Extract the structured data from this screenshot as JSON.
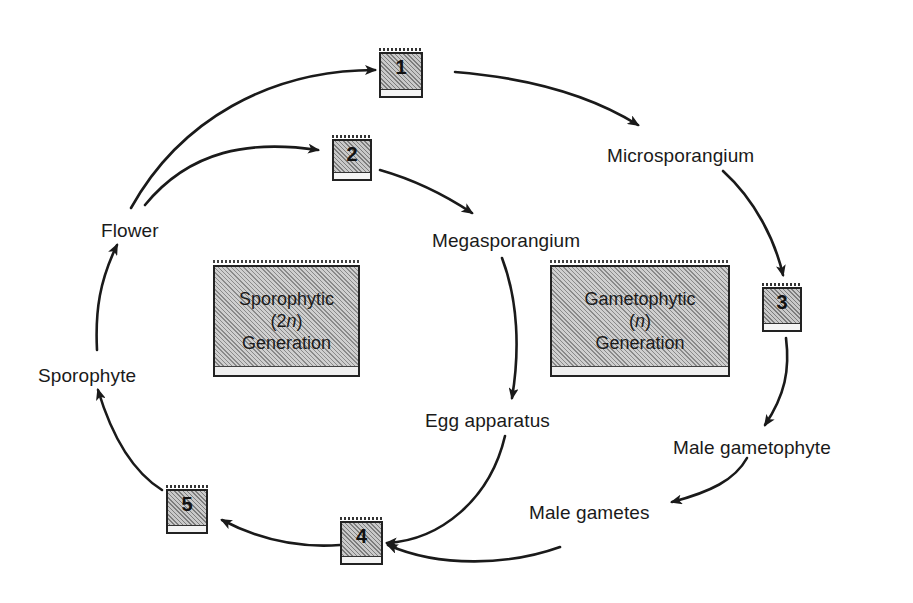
{
  "diagram": {
    "type": "life-cycle",
    "colors": {
      "ink": "#1a1a1a",
      "box_fill": "#a8a8a8",
      "background": "#ffffff"
    },
    "nodes": {
      "flower": "Flower",
      "sporophyte": "Sporophyte",
      "microsporangium": "Microsporangium",
      "megasporangium": "Megasporangium",
      "egg_apparatus": "Egg apparatus",
      "male_gametophyte": "Male gametophyte",
      "male_gametes": "Male gametes"
    },
    "numbered_boxes": [
      {
        "id": "1",
        "label": "1"
      },
      {
        "id": "2",
        "label": "2"
      },
      {
        "id": "3",
        "label": "3"
      },
      {
        "id": "4",
        "label": "4"
      },
      {
        "id": "5",
        "label": "5"
      }
    ],
    "generations": {
      "sporophytic": {
        "line1": "Sporophytic",
        "ploidy_open": "(2",
        "ploidy_var": "n",
        "ploidy_close": ")",
        "line3": "Generation"
      },
      "gametophytic": {
        "line1": "Gametophytic",
        "ploidy_open": "(",
        "ploidy_var": "n",
        "ploidy_close": ")",
        "line3": "Generation"
      }
    },
    "edges": [
      {
        "from": "Flower",
        "to": "1"
      },
      {
        "from": "Flower",
        "to": "2"
      },
      {
        "from": "1",
        "to": "Microsporangium"
      },
      {
        "from": "2",
        "to": "Megasporangium"
      },
      {
        "from": "Microsporangium",
        "to": "3"
      },
      {
        "from": "3",
        "to": "Male gametophyte"
      },
      {
        "from": "Male gametophyte",
        "to": "Male gametes"
      },
      {
        "from": "Male gametes",
        "to": "4"
      },
      {
        "from": "Megasporangium",
        "to": "Egg apparatus"
      },
      {
        "from": "Egg apparatus",
        "to": "4"
      },
      {
        "from": "4",
        "to": "5"
      },
      {
        "from": "5",
        "to": "Sporophyte"
      },
      {
        "from": "Sporophyte",
        "to": "Flower"
      }
    ]
  }
}
